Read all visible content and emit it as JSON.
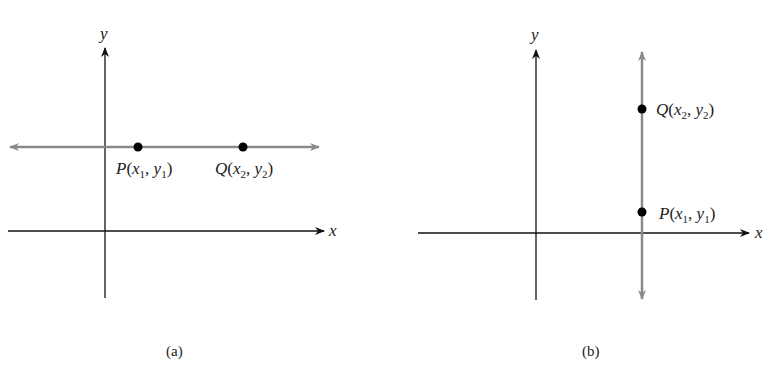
{
  "figure_a": {
    "caption": "(a)",
    "x_axis_label": "x",
    "y_axis_label": "y",
    "line": "horizontal",
    "points": [
      {
        "name": "P",
        "label": "P",
        "coord1": "x",
        "sub1": "1",
        "coord2": "y",
        "sub2": "1"
      },
      {
        "name": "Q",
        "label": "Q",
        "coord1": "x",
        "sub1": "2",
        "coord2": "y",
        "sub2": "2"
      }
    ]
  },
  "figure_b": {
    "caption": "(b)",
    "x_axis_label": "x",
    "y_axis_label": "y",
    "line": "vertical",
    "points": [
      {
        "name": "Q",
        "label": "Q",
        "coord1": "x",
        "sub1": "2",
        "coord2": "y",
        "sub2": "2"
      },
      {
        "name": "P",
        "label": "P",
        "coord1": "x",
        "sub1": "1",
        "coord2": "y",
        "sub2": "1"
      }
    ]
  },
  "colors": {
    "axis": "#111111",
    "line": "#8a8a8a",
    "point": "#000000"
  }
}
